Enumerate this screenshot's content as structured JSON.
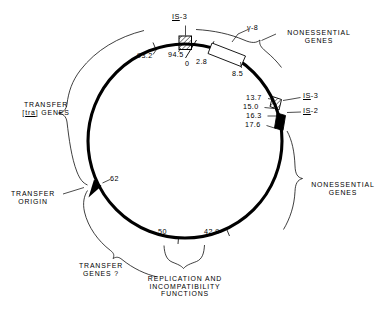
{
  "figure": {
    "name": "f-plasmid-genetic-map",
    "type": "circular-genetic-map",
    "units": "kilobases / map coordinates",
    "stroke_color": "#000000",
    "background_color": "#ffffff"
  },
  "coordinates": {
    "c93_2": "93.2",
    "c94_5": "94.5",
    "c0": "0",
    "c2_8": "2.8",
    "c8_5": "8.5",
    "c13_7": "13.7",
    "c15_0": "15.0",
    "c16_3": "16.3",
    "c17_6": "17.6",
    "c42_9": "42.9",
    "c50": "50",
    "c62": "62"
  },
  "elements": {
    "is3_top_prefix": "IS",
    "is3_top_suffix": "-3",
    "is3_right_prefix": "IS",
    "is3_right_suffix": "-3",
    "is2_right_prefix": "IS",
    "is2_right_suffix": "-2",
    "gamma_delta": "γ-8"
  },
  "regions": {
    "transfer_genes_line1": "TRANSFER",
    "transfer_genes_line2_open": "[",
    "transfer_genes_line2_tra": "tra",
    "transfer_genes_line2_close": "] GENES",
    "transfer_origin_line1": "TRANSFER",
    "transfer_origin_line2": "ORIGIN",
    "transfer_genes_q_line1": "TRANSFER",
    "transfer_genes_q_line2": "GENES ?",
    "nonessential_top_line1": "NONESSENTIAL",
    "nonessential_top_line2": "GENES",
    "nonessential_right_line1": "NONESSENTIAL",
    "nonessential_right_line2": "GENES",
    "replication_line1": "REPLICATION AND",
    "replication_line2": "INCOMPATIBILITY",
    "replication_line3": "FUNCTIONS"
  }
}
